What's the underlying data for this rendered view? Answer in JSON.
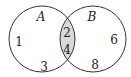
{
  "diagram": {
    "type": "venn",
    "colors": {
      "outline": "#333333",
      "intersection_fill": "#d9d9d9",
      "background": "#ffffff"
    },
    "sets": [
      {
        "name": "A",
        "only_elements": [
          "1",
          "3"
        ]
      },
      {
        "name": "B",
        "only_elements": [
          "6",
          "8"
        ]
      }
    ],
    "intersection": [
      "2",
      "4"
    ]
  }
}
